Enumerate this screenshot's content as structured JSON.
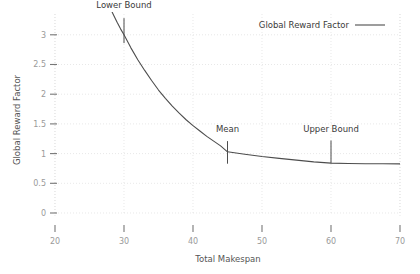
{
  "chart_data": {
    "type": "line",
    "title": "",
    "xlabel": "Total Makespan",
    "ylabel": "Global Reward Factor",
    "xlim": [
      20,
      70
    ],
    "ylim": [
      0,
      3.35
    ],
    "grid": true,
    "legend_position": "top-right",
    "xticks": [
      "20",
      "30",
      "40",
      "50",
      "60",
      "70"
    ],
    "xtick_values": [
      20,
      30,
      40,
      50,
      60,
      70
    ],
    "yticks": [
      "0",
      "0.5",
      "1",
      "1.5",
      "2",
      "2.5",
      "3"
    ],
    "ytick_values": [
      0,
      0.5,
      1,
      1.5,
      2,
      2.5,
      3
    ],
    "series": [
      {
        "name": "Global Reward Factor",
        "x": [
          28.0,
          28.5,
          29.0,
          29.5,
          30.0,
          31.0,
          32.0,
          33.0,
          34.0,
          35.0,
          36.0,
          37.0,
          38.0,
          39.0,
          40.0,
          41.0,
          42.0,
          43.0,
          44.0,
          45.0,
          47.5,
          50.0,
          52.5,
          55.0,
          57.5,
          60.0,
          62.5,
          65.0,
          67.5,
          70.0
        ],
        "y": [
          3.45,
          3.33,
          3.21,
          3.1,
          3.0,
          2.78,
          2.58,
          2.4,
          2.23,
          2.07,
          1.93,
          1.8,
          1.68,
          1.57,
          1.47,
          1.38,
          1.29,
          1.21,
          1.13,
          1.03,
          0.99,
          0.95,
          0.92,
          0.89,
          0.86,
          0.84,
          0.833,
          0.83,
          0.828,
          0.827
        ]
      }
    ],
    "annotations": [
      {
        "label": "Lower Bound",
        "x": 30,
        "marker_y_top": 3.28,
        "marker_y_bottom": 2.86,
        "label_x": 30,
        "label_y": 3.45
      },
      {
        "label": "Mean",
        "x": 45,
        "marker_y_top": 1.21,
        "marker_y_bottom": 0.83,
        "label_x": 45,
        "label_y": 1.36
      },
      {
        "label": "Upper Bound",
        "x": 60,
        "marker_y_top": 1.22,
        "marker_y_bottom": 0.84,
        "label_x": 60,
        "label_y": 1.37
      }
    ],
    "legend": [
      {
        "label": "Global Reward Factor",
        "color": "#4d4d4d"
      }
    ],
    "colors": {
      "series": "#4d4d4d",
      "grid": "#d8d8d8",
      "axis": "#b8b8b8",
      "tick_label": "#9a9a9a",
      "axis_title": "#555555",
      "annotation": "#3a3a3a",
      "background": "#ffffff"
    }
  }
}
